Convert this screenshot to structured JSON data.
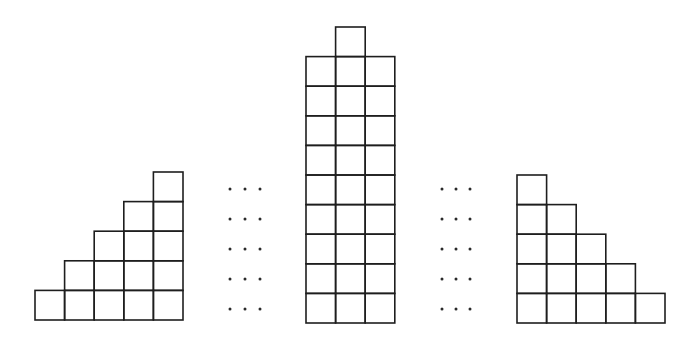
{
  "diagram": {
    "stroke_color": "#1e1e1e",
    "background": "#ffffff",
    "cell_size": 29.6,
    "figures": [
      {
        "name": "left-staircase",
        "origin_x": 35,
        "baseline_y": 320,
        "column_heights": [
          1,
          2,
          3,
          4,
          5
        ]
      },
      {
        "name": "center-block",
        "origin_x": 306,
        "baseline_y": 323,
        "column_heights": [
          9,
          10,
          9
        ]
      },
      {
        "name": "right-staircase",
        "origin_x": 517,
        "baseline_y": 323,
        "column_heights": [
          5,
          4,
          3,
          2,
          1
        ]
      }
    ],
    "ellipses": [
      {
        "name": "left-ellipsis",
        "xs": [
          230,
          245,
          260
        ],
        "ys": [
          189,
          219,
          249,
          279,
          309
        ],
        "glyph": "⋯"
      },
      {
        "name": "right-ellipsis",
        "xs": [
          442,
          456,
          470
        ],
        "ys": [
          189,
          219,
          249,
          279,
          309
        ],
        "glyph": "⋯"
      }
    ]
  }
}
